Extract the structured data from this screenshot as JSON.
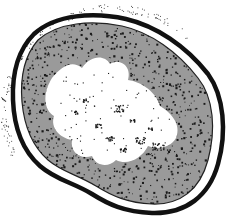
{
  "figure": {
    "colors": {
      "background": "#ffffff",
      "cell_wall": "#111111",
      "cytoplasm": "#9a9a9a",
      "stipple": "#1a1a1a",
      "nucleoid": "#ffffff"
    },
    "parts": [
      "outer-fuzz",
      "cell-wall",
      "membrane-gap",
      "cytoplasm",
      "nucleoid",
      "inclusions"
    ],
    "stipple_seed": 7
  }
}
